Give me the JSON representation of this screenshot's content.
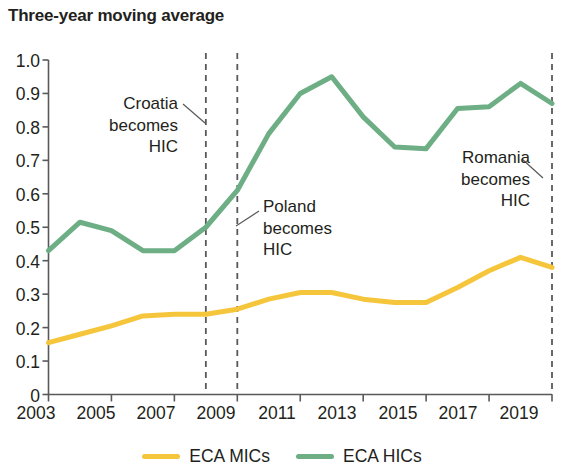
{
  "chart_data": {
    "type": "line",
    "title": "Three-year moving average",
    "xlabel": "",
    "ylabel": "",
    "xlim": [
      2003,
      2019
    ],
    "ylim": [
      0,
      1.0
    ],
    "grid": false,
    "legend_position": "bottom",
    "x": [
      2003,
      2004,
      2005,
      2006,
      2007,
      2008,
      2009,
      2010,
      2011,
      2012,
      2013,
      2014,
      2015,
      2016,
      2017,
      2018,
      2019
    ],
    "series": [
      {
        "name": "ECA MICs",
        "color": "#F5C63C",
        "values": [
          0.155,
          0.18,
          0.205,
          0.235,
          0.24,
          0.24,
          0.255,
          0.285,
          0.305,
          0.305,
          0.285,
          0.275,
          0.275,
          0.32,
          0.37,
          0.41,
          0.38
        ]
      },
      {
        "name": "ECA HICs",
        "color": "#6DAE85",
        "values": [
          0.43,
          0.515,
          0.49,
          0.43,
          0.43,
          0.5,
          0.61,
          0.78,
          0.9,
          0.95,
          0.83,
          0.74,
          0.735,
          0.855,
          0.86,
          0.93,
          0.87
        ]
      }
    ],
    "ytick_labels": [
      "1.0",
      "0.9",
      "0.8",
      "0.7",
      "0.6",
      "0.5",
      "0.4",
      "0.3",
      "0.2",
      "0.1",
      "0"
    ],
    "ytick_values": [
      1.0,
      0.9,
      0.8,
      0.7,
      0.6,
      0.5,
      0.4,
      0.3,
      0.2,
      0.1,
      0
    ],
    "xtick_labels": [
      "2003",
      "2005",
      "2007",
      "2009",
      "2011",
      "2013",
      "2015",
      "2017",
      "2019"
    ],
    "xtick_values": [
      2003,
      2005,
      2007,
      2009,
      2011,
      2013,
      2015,
      2017,
      2019
    ],
    "annotations": [
      {
        "id": "croatia",
        "text": "Croatia\nbecomes\nHIC",
        "at_year": 2008,
        "align": "right"
      },
      {
        "id": "poland",
        "text": "Poland\nbecomes\nHIC",
        "at_year": 2009,
        "align": "left"
      },
      {
        "id": "romania",
        "text": "Romania\nbecomes\nHIC",
        "at_year": 2019,
        "align": "right"
      }
    ],
    "vlines": [
      2008,
      2009,
      2019
    ]
  },
  "legend": {
    "items": [
      {
        "label": "ECA MICs",
        "color": "#F5C63C"
      },
      {
        "label": "ECA HICs",
        "color": "#6DAE85"
      }
    ]
  },
  "axis": {
    "y_labels": {
      "t0": "1.0",
      "t1": "0.9",
      "t2": "0.8",
      "t3": "0.7",
      "t4": "0.6",
      "t5": "0.5",
      "t6": "0.4",
      "t7": "0.3",
      "t8": "0.2",
      "t9": "0.1",
      "t10": "0"
    },
    "x_labels": {
      "t0": "2003",
      "t1": "2005",
      "t2": "2007",
      "t3": "2009",
      "t4": "2011",
      "t5": "2013",
      "t6": "2015",
      "t7": "2017",
      "t8": "2019"
    }
  },
  "annotations_text": {
    "croatia": "Croatia\nbecomes\nHIC",
    "poland": "Poland\nbecomes\nHIC",
    "romania": "Romania\nbecomes\nHIC"
  }
}
